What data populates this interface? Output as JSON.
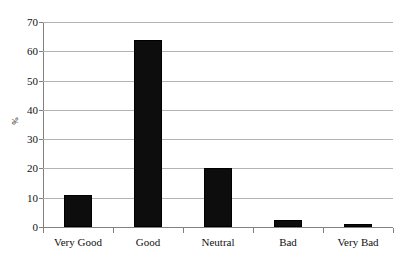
{
  "chart_data": {
    "type": "bar",
    "title": "",
    "subtitle": "",
    "xlabel": "",
    "ylabel": "%",
    "categories": [
      "Very Good",
      "Good",
      "Neutral",
      "Bad",
      "Very Bad"
    ],
    "values": [
      11,
      64,
      20,
      2.5,
      1
    ],
    "series": [
      {
        "name": "",
        "values": [
          11,
          64,
          20,
          2.5,
          1
        ]
      }
    ],
    "ylim": [
      0,
      70
    ],
    "ytick_labels": [
      "0",
      "10",
      "20",
      "30",
      "40",
      "50",
      "60",
      "70"
    ],
    "ytick_values": [
      0,
      10,
      20,
      30,
      40,
      50,
      60,
      70
    ],
    "grid": true,
    "grid_axis": "y",
    "legend": false,
    "legend_position": "none",
    "bar_color": "#0d0d0d",
    "gridline_color": "#b3b3b3",
    "axis_color": "#808080",
    "background_color": "#ffffff"
  }
}
